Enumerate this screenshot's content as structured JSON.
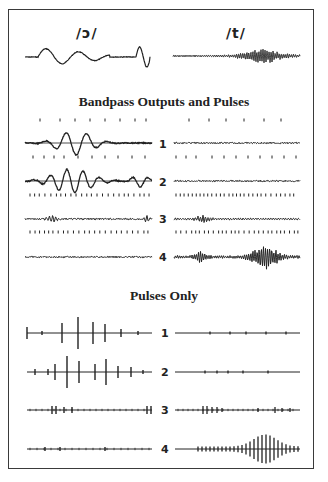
{
  "figure": {
    "phonemes": {
      "left": "/ɔ/",
      "right": "/t/"
    },
    "sections": {
      "bandpass_title": "Bandpass Outputs and Pulses",
      "pulses_title": "Pulses Only"
    },
    "channels": [
      "1",
      "2",
      "3",
      "4"
    ],
    "colors": {
      "ink": "#222222",
      "frame": "#3a3a3a",
      "background": "#ffffff"
    }
  }
}
